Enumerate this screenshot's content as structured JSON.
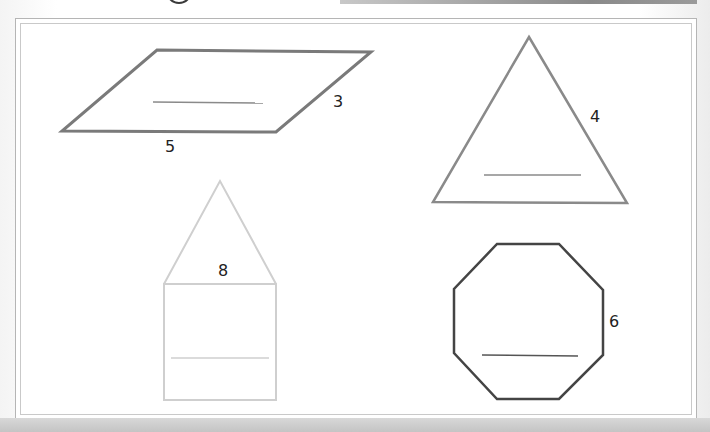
{
  "worksheet": {
    "shapes": [
      {
        "name": "parallelogram",
        "side_labels": [
          {
            "text": "5",
            "position": "bottom"
          },
          {
            "text": "3",
            "position": "right"
          }
        ],
        "answer_blank": "",
        "stroke": "#7a7a7a"
      },
      {
        "name": "triangle",
        "side_labels": [
          {
            "text": "4",
            "position": "right"
          }
        ],
        "answer_blank": "",
        "stroke": "#8a8a8a"
      },
      {
        "name": "house-pentagon",
        "side_labels": [
          {
            "text": "8",
            "position": "middle"
          }
        ],
        "answer_blank": "",
        "stroke": "#cfcfcf"
      },
      {
        "name": "octagon",
        "side_labels": [
          {
            "text": "6",
            "position": "right"
          }
        ],
        "answer_blank": "",
        "stroke": "#444444"
      }
    ]
  }
}
